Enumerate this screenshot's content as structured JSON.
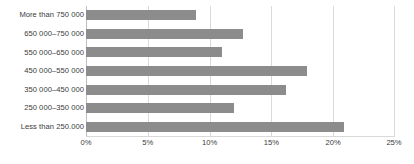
{
  "chart_data": {
    "type": "bar",
    "orientation": "horizontal",
    "title": "",
    "xlabel": "",
    "ylabel": "",
    "xlim": [
      0,
      25
    ],
    "xtick_labels": [
      "0%",
      "5%",
      "10%",
      "15%",
      "20%",
      "25%"
    ],
    "xticks": [
      0,
      5,
      10,
      15,
      20,
      25
    ],
    "grid": true,
    "legend": "none",
    "bar_color": "#8c8c8c",
    "gridline_color": "#d9d9d9",
    "categories": [
      "More than 750 000",
      "650 000–750 000",
      "550 000–650 000",
      "450 000–550 000",
      "350 000–450 000",
      "250 000–350 000",
      "Less than 250.000"
    ],
    "values": [
      8.9,
      12.7,
      11.0,
      17.9,
      16.2,
      12.0,
      20.9
    ],
    "value_unit": "%"
  }
}
